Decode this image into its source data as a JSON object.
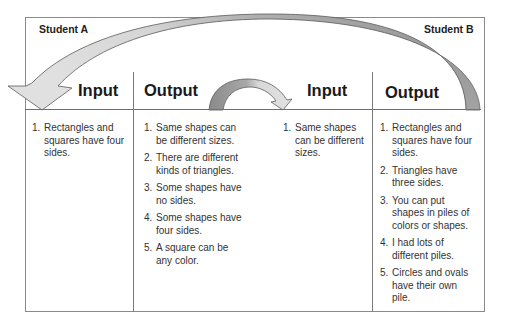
{
  "students": {
    "a": {
      "label": "Student A",
      "input": {
        "title": "Input",
        "items": [
          {
            "num": "1.",
            "text": "Rectangles and squares have four sides."
          }
        ]
      },
      "output": {
        "title": "Output",
        "items": [
          {
            "num": "1.",
            "text": "Same shapes can be different sizes."
          },
          {
            "num": "2.",
            "text": "There are different kinds of triangles."
          },
          {
            "num": "3.",
            "text": "Some shapes have no sides."
          },
          {
            "num": "4.",
            "text": "Some shapes have four sides."
          },
          {
            "num": "5.",
            "text": "A square can be any color."
          }
        ]
      }
    },
    "b": {
      "label": "Student B",
      "input": {
        "title": "Input",
        "items": [
          {
            "num": "1.",
            "text": "Same shapes can be different sizes."
          }
        ]
      },
      "output": {
        "title": "Output",
        "items": [
          {
            "num": "1.",
            "text": "Rectangles and squares have four sides."
          },
          {
            "num": "2.",
            "text": "Triangles have three sides."
          },
          {
            "num": "3.",
            "text": "You can put shapes in piles of colors or shapes."
          },
          {
            "num": "4.",
            "text": "I had lots of different piles."
          },
          {
            "num": "5.",
            "text": "Circles and ovals have their own pile."
          }
        ]
      }
    }
  },
  "arrows": [
    {
      "name": "b-output-to-a-input",
      "from": "Student B Output",
      "to": "Student A Input",
      "fill": "#d8d8d8",
      "tail_fill": "#8c8c8c"
    },
    {
      "name": "a-output-to-b-input",
      "from": "Student A Output",
      "to": "Student B Input",
      "fill": "#d8d8d8",
      "tail_fill": "#8c8c8c"
    }
  ],
  "colors": {
    "border": "#8a8a8a",
    "arrow_light": "#d8d8d8",
    "arrow_dark": "#8c8c8c",
    "text": "#333333"
  }
}
